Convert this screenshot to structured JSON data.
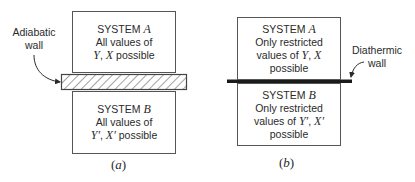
{
  "panel_a": {
    "caption_open": "(",
    "caption_letter": "a",
    "caption_close": ")",
    "wall_label_line1": "Adiabatic",
    "wall_label_line2": "wall",
    "system_a": {
      "title": "SYSTEM",
      "title_var": "A",
      "line2": "All values of",
      "var1": "Y",
      "sep": ", ",
      "var2": "X",
      "line3_rest": " possible"
    },
    "system_b": {
      "title": "SYSTEM",
      "title_var": "B",
      "line2": "All values of",
      "var1": "Y′",
      "sep": ", ",
      "var2": "X′",
      "line3_rest": " possible"
    }
  },
  "panel_b": {
    "caption_open": "(",
    "caption_letter": "b",
    "caption_close": ")",
    "wall_label_line1": "Diathermic",
    "wall_label_line2": "wall",
    "system_a": {
      "title": "SYSTEM",
      "title_var": "A",
      "line2": "Only restricted",
      "line3_pre": "values of ",
      "var1": "Y",
      "sep": ", ",
      "var2": "X",
      "line4": "possible"
    },
    "system_b": {
      "title": "SYSTEM",
      "title_var": "B",
      "line2": "Only restricted",
      "line3_pre": "values of ",
      "var1": "Y′",
      "sep": ", ",
      "var2": "X′",
      "line4": "possible"
    }
  },
  "colors": {
    "stroke": "#555555",
    "wall_dark": "#1a1a1a",
    "text": "#2a2a2a"
  }
}
